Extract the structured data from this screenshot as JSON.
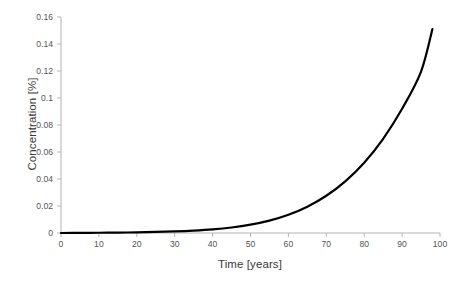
{
  "chart_data": {
    "type": "line",
    "title": "",
    "xlabel": "Time [years]",
    "ylabel": "Concentration [%]",
    "xlim": [
      0,
      100
    ],
    "ylim": [
      0,
      0.16
    ],
    "xticks": [
      0,
      10,
      20,
      30,
      40,
      50,
      60,
      70,
      80,
      90,
      100
    ],
    "xtick_labels": [
      "0",
      "10",
      "20",
      "30",
      "40",
      "50",
      "60",
      "70",
      "80",
      "90",
      "100"
    ],
    "yticks": [
      0,
      0.02,
      0.04,
      0.06,
      0.08,
      0.1,
      0.12,
      0.14,
      0.16
    ],
    "ytick_labels": [
      "0",
      "0.02",
      "0.04",
      "0.06",
      "0.08",
      "0.1",
      "0.12",
      "0.14",
      "0.16"
    ],
    "grid": false,
    "legend": false,
    "legend_position": "none",
    "series": [
      {
        "name": "Concentration",
        "color": "#000000",
        "line_width": 2.2,
        "x": [
          0,
          5,
          10,
          15,
          20,
          25,
          30,
          35,
          40,
          45,
          50,
          55,
          60,
          65,
          70,
          75,
          80,
          85,
          90,
          95,
          98
        ],
        "values": [
          0.0,
          0.0001,
          0.0002,
          0.0003,
          0.0005,
          0.0008,
          0.0012,
          0.0018,
          0.0027,
          0.0041,
          0.0062,
          0.0092,
          0.0135,
          0.0195,
          0.0276,
          0.0383,
          0.0521,
          0.0698,
          0.092,
          0.1196,
          0.151
        ]
      }
    ],
    "axis_color": "#b4b4b4",
    "tick_color": "#b4b4b4",
    "text_color": "#3f3f3f",
    "background": "#ffffff"
  },
  "geometry": {
    "plot_left": 61,
    "plot_right": 440,
    "plot_top": 17,
    "plot_bottom": 233
  }
}
